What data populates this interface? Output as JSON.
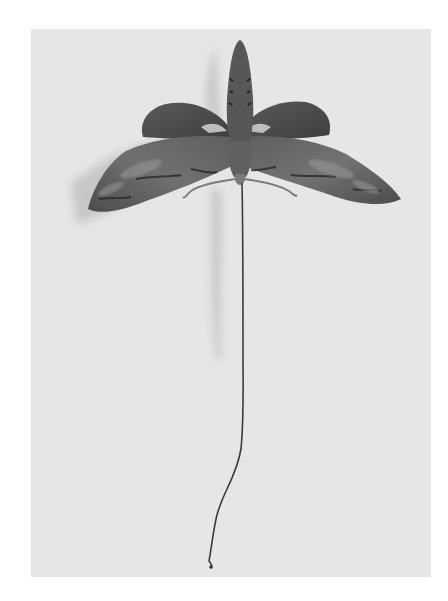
{
  "image": {
    "subject": "Moth specimen with extended long proboscis",
    "alt": "Grayscale photograph of a pinned hawk moth with spread wings, curved antennae, and a very long uncoiled proboscis hanging downward",
    "colors": {
      "page_background": "#ffffff",
      "photo_background": "#e6e6e6",
      "wing_dark": "#4a4a4a",
      "wing_mid": "#6e6e6e",
      "body": "#555555",
      "shadow": "#c4c4c4",
      "proboscis": "#3c3c3c"
    }
  }
}
